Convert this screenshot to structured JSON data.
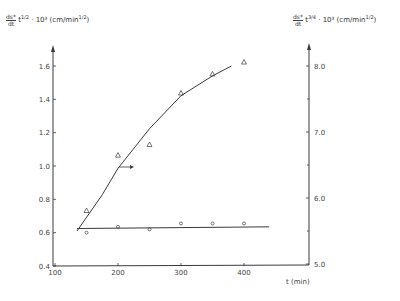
{
  "chart_data": {
    "type": "scatter",
    "title": "",
    "xlabel": "t (min)",
    "ylabel_left": "ds*/dt · t^(1/2) · 10^3 (cm/min^(1/2))",
    "ylabel_right": "ds*/dt · t^(3/4) · 10^3 (cm/min^(1/2))",
    "xlim": [
      100,
      450
    ],
    "ylim_left": [
      0.4,
      1.7
    ],
    "ylim_right": [
      5.0,
      8.3
    ],
    "x_ticks": [
      100,
      200,
      300,
      400
    ],
    "y_ticks_left": [
      0.4,
      0.6,
      0.8,
      1.0,
      1.2,
      1.4,
      1.6
    ],
    "y_ticks_right": [
      5.0,
      6.0,
      7.0,
      8.0
    ],
    "grid": false,
    "legend": null,
    "series": [
      {
        "name": "circles (left axis, t^1/2 scaling)",
        "marker": "circle",
        "axis": "left",
        "x": [
          150,
          200,
          250,
          300,
          350,
          400
        ],
        "values": [
          0.6,
          0.635,
          0.62,
          0.655,
          0.655,
          0.655
        ]
      },
      {
        "name": "triangles (right axis, t^3/4 scaling)",
        "marker": "triangle",
        "axis": "right",
        "x": [
          150,
          200,
          250,
          300,
          350,
          400
        ],
        "values": [
          5.81,
          6.65,
          6.81,
          7.59,
          7.88,
          8.06
        ]
      }
    ],
    "fit_lines": [
      {
        "name": "horizontal fit (circles)",
        "axis": "left",
        "x": [
          135,
          440
        ],
        "values": [
          0.625,
          0.635
        ]
      },
      {
        "name": "curve fit (triangles)",
        "axis": "right",
        "x": [
          135,
          175,
          200,
          250,
          300,
          350,
          380
        ],
        "values": [
          5.5,
          6.05,
          6.45,
          7.05,
          7.55,
          7.85,
          8.0
        ]
      }
    ],
    "annotations": [
      {
        "type": "arrow",
        "direction": "right",
        "near_x": 200,
        "meaning": "triangle series refers to right axis"
      }
    ]
  },
  "labels": {
    "left_axis_prefix_num": "ds*",
    "left_axis_prefix_den": "dt",
    "left_axis_rest": "t",
    "left_axis_exp": "1/2",
    "left_axis_units": "· 10³ (cm/min",
    "left_axis_units_exp": "1/2",
    "right_axis_prefix_num": "ds*",
    "right_axis_prefix_den": "dt",
    "right_axis_rest": "t",
    "right_axis_exp": "3/4",
    "right_axis_units": "· 10³ (cm/min",
    "right_axis_units_exp": "1/2",
    "x_axis": "t (min)"
  }
}
